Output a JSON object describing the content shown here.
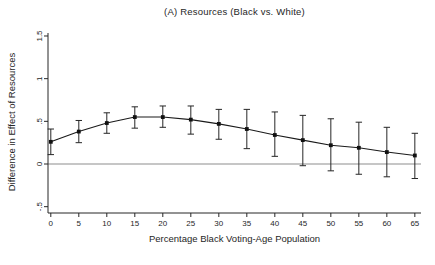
{
  "chart_data": {
    "type": "line",
    "title": "(A) Resources (Black vs. White)",
    "xlabel": "Percentage Black Voting-Age Population",
    "ylabel": "Difference in Effect of Resources",
    "x": [
      0,
      5,
      10,
      15,
      20,
      25,
      30,
      35,
      40,
      45,
      50,
      55,
      60,
      65
    ],
    "series": [
      {
        "name": "Estimated difference in effect of resources",
        "values": [
          0.26,
          0.38,
          0.48,
          0.55,
          0.55,
          0.52,
          0.47,
          0.41,
          0.34,
          0.28,
          0.22,
          0.19,
          0.14,
          0.1
        ]
      }
    ],
    "error_bars": true,
    "ci_lower": [
      0.11,
      0.25,
      0.36,
      0.42,
      0.43,
      0.35,
      0.29,
      0.18,
      0.09,
      -0.02,
      -0.08,
      -0.12,
      -0.15,
      -0.17
    ],
    "ci_upper": [
      0.41,
      0.51,
      0.6,
      0.67,
      0.68,
      0.68,
      0.64,
      0.64,
      0.61,
      0.57,
      0.53,
      0.49,
      0.43,
      0.36
    ],
    "x_ticks": [
      0,
      5,
      10,
      15,
      20,
      25,
      30,
      35,
      40,
      45,
      50,
      55,
      60,
      65
    ],
    "x_tick_labels": [
      "0",
      "5",
      "10",
      "15",
      "20",
      "25",
      "30",
      "35",
      "40",
      "45",
      "50",
      "55",
      "60",
      "65"
    ],
    "y_ticks": [
      -0.5,
      0,
      0.5,
      1,
      1.5
    ],
    "y_tick_labels": [
      "-.5",
      "0",
      ".5",
      "1",
      "1.5"
    ],
    "xlim": [
      -0.5,
      66.1
    ],
    "ylim": [
      -0.574,
      1.535
    ],
    "reference_line_y": 0,
    "grid": false,
    "legend": false,
    "marker": "filled-square",
    "y_tick_label_rotation": -90,
    "colors": {
      "line": "#1a1a1a",
      "marker": "#111111",
      "error_bar": "#262626",
      "axis": "#262626",
      "zero_line": "#b3b3b3",
      "text": "#262626",
      "background": "#ffffff"
    }
  }
}
